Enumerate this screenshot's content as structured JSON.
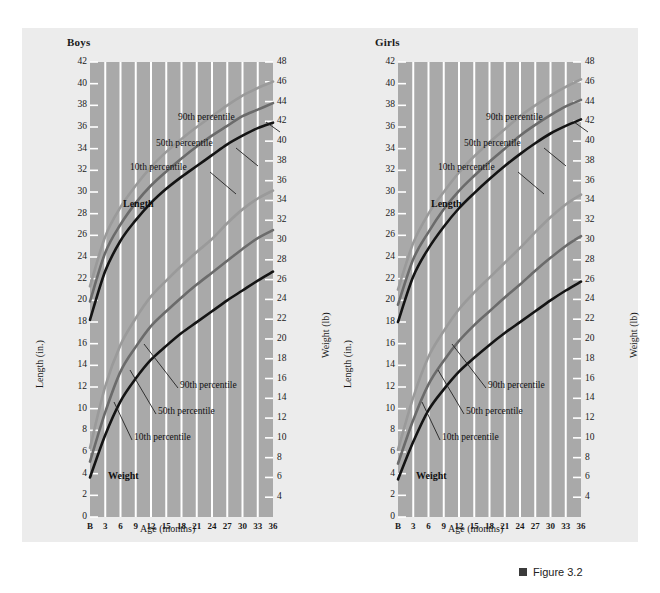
{
  "figure": {
    "caption": "Figure 3.2",
    "marker_color": "#3b3b3b"
  },
  "colors": {
    "page_background": "#ffffff",
    "panel_background": "#ececec",
    "plot_background": "#a9a9a9",
    "gridline": "#ffffff",
    "p90": "#9a9a9a",
    "p50": "#6b6b6b",
    "p10": "#141414",
    "text": "#1a1a1a"
  },
  "panels": [
    {
      "id": "boys",
      "title": "Boys",
      "xlabel": "Age (months)",
      "ylabel_left": "Length (in.)",
      "ylabel_right": "Weight (lb)",
      "annotations": {
        "length_series": "Length",
        "weight_series": "Weight",
        "length_p90": "90th percentile",
        "length_p50": "50th percentile",
        "length_p10": "10th percentile",
        "weight_p90": "90th percentile",
        "weight_p50": "50th percentile",
        "weight_p10": "10th percentile"
      }
    },
    {
      "id": "girls",
      "title": "Girls",
      "xlabel": "Age (months)",
      "ylabel_left": "Length (in.)",
      "ylabel_right": "Weight (lb)",
      "annotations": {
        "length_series": "Length",
        "weight_series": "Weight",
        "length_p90": "90th percentile",
        "length_p50": "50th percentile",
        "length_p10": "10th percentile",
        "weight_p90": "90th percentile",
        "weight_p50": "50th percentile",
        "weight_p10": "10th percentile"
      }
    }
  ],
  "chart_data": [
    {
      "type": "line",
      "title": "Boys",
      "xlabel": "Age (months)",
      "ylabel": "Length (in.)",
      "ylabel_secondary": "Weight (lb)",
      "x": [
        0,
        3,
        6,
        9,
        12,
        15,
        18,
        21,
        24,
        27,
        30,
        33,
        36
      ],
      "xtick_labels": [
        "B",
        "3",
        "6",
        "9",
        "12",
        "15",
        "18",
        "21",
        "24",
        "27",
        "30",
        "33",
        "36"
      ],
      "ylim": [
        0,
        42
      ],
      "ytick_labels": [
        "0",
        "2",
        "4",
        "6",
        "8",
        "10",
        "12",
        "14",
        "16",
        "18",
        "20",
        "22",
        "24",
        "26",
        "28",
        "30",
        "32",
        "34",
        "36",
        "38",
        "40",
        "42"
      ],
      "ylim_secondary": [
        2,
        48
      ],
      "ytick_labels_secondary": [
        "4",
        "6",
        "8",
        "10",
        "12",
        "14",
        "16",
        "18",
        "20",
        "22",
        "24",
        "26",
        "28",
        "30",
        "32",
        "34",
        "36",
        "38",
        "40",
        "42",
        "44",
        "46",
        "48"
      ],
      "grid": "vertical",
      "legend_position": "inline-annotations",
      "series": [
        {
          "name": "Length 90th percentile",
          "axis": "left",
          "color": "#9a9a9a",
          "values": [
            21.3,
            25.9,
            28.6,
            30.6,
            32.3,
            33.7,
            34.9,
            36.0,
            37.0,
            38.0,
            38.9,
            39.6,
            40.2
          ]
        },
        {
          "name": "Length 50th percentile",
          "axis": "left",
          "color": "#6b6b6b",
          "values": [
            19.9,
            24.4,
            27.0,
            29.0,
            30.6,
            31.9,
            33.1,
            34.2,
            35.2,
            36.1,
            37.0,
            37.6,
            38.2
          ]
        },
        {
          "name": "Length 10th percentile",
          "axis": "left",
          "color": "#141414",
          "values": [
            18.2,
            22.7,
            25.5,
            27.4,
            29.0,
            30.3,
            31.4,
            32.4,
            33.4,
            34.4,
            35.2,
            35.9,
            36.4
          ]
        },
        {
          "name": "Weight 90th percentile",
          "axis": "right",
          "color": "#9a9a9a",
          "values": [
            9.0,
            15.2,
            19.4,
            22.1,
            24.3,
            25.9,
            27.4,
            28.8,
            30.1,
            31.7,
            33.1,
            34.2,
            35.0
          ]
        },
        {
          "name": "Weight 50th percentile",
          "axis": "right",
          "color": "#6b6b6b",
          "values": [
            7.6,
            12.6,
            16.7,
            19.2,
            21.3,
            22.8,
            24.2,
            25.5,
            26.7,
            27.9,
            29.1,
            30.2,
            31.0
          ]
        },
        {
          "name": "Weight 10th percentile",
          "axis": "right",
          "color": "#141414",
          "values": [
            6.0,
            10.3,
            13.7,
            16.0,
            17.9,
            19.3,
            20.6,
            21.7,
            22.8,
            23.9,
            24.9,
            25.9,
            26.8
          ]
        }
      ]
    },
    {
      "type": "line",
      "title": "Girls",
      "xlabel": "Age (months)",
      "ylabel": "Length (in.)",
      "ylabel_secondary": "Weight (lb)",
      "x": [
        0,
        3,
        6,
        9,
        12,
        15,
        18,
        21,
        24,
        27,
        30,
        33,
        36
      ],
      "xtick_labels": [
        "B",
        "3",
        "6",
        "9",
        "12",
        "15",
        "18",
        "21",
        "24",
        "27",
        "30",
        "33",
        "36"
      ],
      "ylim": [
        0,
        42
      ],
      "ytick_labels": [
        "0",
        "2",
        "4",
        "6",
        "8",
        "10",
        "12",
        "14",
        "16",
        "18",
        "20",
        "22",
        "24",
        "26",
        "28",
        "30",
        "32",
        "34",
        "36",
        "38",
        "40",
        "42"
      ],
      "ylim_secondary": [
        2,
        48
      ],
      "ytick_labels_secondary": [
        "4",
        "6",
        "8",
        "10",
        "12",
        "14",
        "16",
        "18",
        "20",
        "22",
        "24",
        "26",
        "28",
        "30",
        "32",
        "34",
        "36",
        "38",
        "40",
        "42",
        "44",
        "46",
        "48"
      ],
      "grid": "vertical",
      "legend_position": "inline-annotations",
      "series": [
        {
          "name": "Length 90th percentile",
          "axis": "left",
          "color": "#9a9a9a",
          "values": [
            21.0,
            25.3,
            28.0,
            30.0,
            31.8,
            33.3,
            34.6,
            35.8,
            37.0,
            38.0,
            38.9,
            39.7,
            40.4
          ]
        },
        {
          "name": "Length 50th percentile",
          "axis": "left",
          "color": "#6b6b6b",
          "values": [
            19.6,
            23.8,
            26.3,
            28.4,
            30.1,
            31.5,
            32.8,
            34.0,
            35.2,
            36.2,
            37.1,
            37.9,
            38.5
          ]
        },
        {
          "name": "Length 10th percentile",
          "axis": "left",
          "color": "#141414",
          "values": [
            18.0,
            22.2,
            24.8,
            26.8,
            28.5,
            29.9,
            31.2,
            32.4,
            33.5,
            34.5,
            35.4,
            36.1,
            36.7
          ]
        },
        {
          "name": "Weight 90th percentile",
          "axis": "right",
          "color": "#9a9a9a",
          "values": [
            8.8,
            14.1,
            18.2,
            20.8,
            23.0,
            24.7,
            26.2,
            27.7,
            29.2,
            30.8,
            32.3,
            33.6,
            34.6
          ]
        },
        {
          "name": "Weight 50th percentile",
          "axis": "right",
          "color": "#6b6b6b",
          "values": [
            7.4,
            11.8,
            15.4,
            17.8,
            19.8,
            21.4,
            22.8,
            24.2,
            25.5,
            26.9,
            28.2,
            29.4,
            30.4
          ]
        },
        {
          "name": "Weight 10th percentile",
          "axis": "right",
          "color": "#141414",
          "values": [
            5.8,
            9.6,
            12.8,
            14.9,
            16.7,
            18.1,
            19.4,
            20.6,
            21.7,
            22.8,
            23.9,
            24.9,
            25.8
          ]
        }
      ]
    }
  ]
}
